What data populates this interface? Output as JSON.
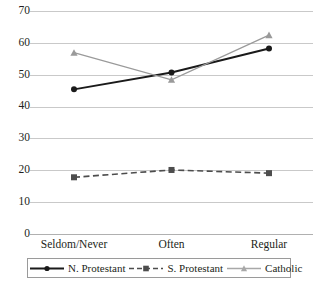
{
  "chart_data": {
    "type": "line",
    "title": "",
    "xlabel": "",
    "ylabel": "",
    "categories": [
      "Seldom/Never",
      "Often",
      "Regular"
    ],
    "ylim": [
      0,
      70
    ],
    "yticks": [
      0,
      10,
      20,
      30,
      40,
      50,
      60,
      70
    ],
    "ytick_labels": [
      "0",
      "10",
      "20",
      "30",
      "40",
      "50",
      "60",
      "70"
    ],
    "grid": true,
    "legend_position": "bottom",
    "series": [
      {
        "name": "N. Protestant",
        "values": [
          45.4,
          50.7,
          58.2
        ],
        "color": "#1a1a1a",
        "marker": "circle",
        "dash": "solid"
      },
      {
        "name": "S. Protestant",
        "values": [
          17.8,
          20.1,
          19.1
        ],
        "color": "#4d4d4d",
        "marker": "square",
        "dash": "dashed"
      },
      {
        "name": "Catholic",
        "values": [
          56.9,
          48.4,
          62.4
        ],
        "color": "#9a9a9a",
        "marker": "triangle",
        "dash": "solid"
      }
    ]
  },
  "legend": {
    "entries": [
      {
        "label": "N. Protestant"
      },
      {
        "label": "S. Protestant"
      },
      {
        "label": "Catholic"
      }
    ]
  }
}
